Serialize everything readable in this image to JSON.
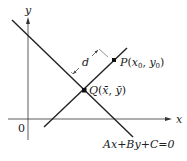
{
  "diagram": {
    "type": "geometry",
    "axes": {
      "x_label": "x",
      "y_label": "y",
      "origin_label": "0"
    },
    "line": {
      "equation": "Ax+By+C=0"
    },
    "perpendicular": {
      "distance_label": "d"
    },
    "points": {
      "P": {
        "name": "P",
        "coords_label": "(x0, y0)",
        "display": "P(x₀, y₀)"
      },
      "Q": {
        "name": "Q",
        "coords_label": "(x̄, ȳ)",
        "display": "Q(x̄, ȳ)"
      }
    },
    "colors": {
      "stroke": "#222222",
      "background": "#ffffff"
    }
  }
}
